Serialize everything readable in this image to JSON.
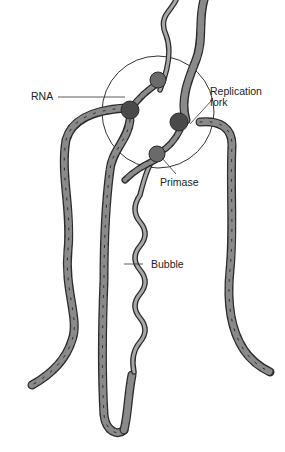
{
  "diagram": {
    "type": "DNA replication initiation schematic",
    "labels": {
      "rna": "RNA",
      "replication_fork_line1": "Replication",
      "replication_fork_line2": "fork",
      "primase": "Primase",
      "bubble": "Bubble"
    },
    "colors": {
      "strand_fill": "#8a8a8a",
      "strand_outline": "#2a2a2a",
      "enzyme_fill": "#5e5e5e",
      "enzyme_dark": "#444444",
      "circle_outline": "#333333",
      "label_text": "#222222"
    }
  }
}
